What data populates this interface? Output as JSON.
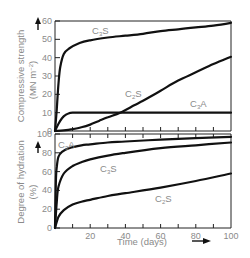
{
  "chart_data": [
    {
      "type": "line",
      "title": "",
      "xlabel": "Time (days)",
      "ylabel": "Compressive strength (MN m^-2)",
      "ylabel_line1": "Compressive strength",
      "ylabel_line2": "(MN m",
      "ylabel_sup": "-2",
      "ylabel_close": ")",
      "xlim": [
        0,
        100
      ],
      "ylim": [
        0,
        60
      ],
      "yticks": [
        "0",
        "10",
        "20",
        "30",
        "40",
        "50",
        "60"
      ],
      "xticks": [
        0,
        10,
        20,
        30,
        40,
        50,
        60,
        70,
        80,
        90,
        100
      ],
      "grid": false,
      "series": [
        {
          "name": "C3S",
          "label_main": "C",
          "label_sub": "3",
          "label_end": "S",
          "x": [
            0,
            1,
            2,
            3,
            5,
            8,
            14,
            20,
            30,
            40,
            50,
            60,
            70,
            80,
            90,
            100
          ],
          "values": [
            0,
            12,
            26,
            35,
            42,
            45,
            48,
            49.5,
            51,
            52,
            53,
            54.5,
            55.5,
            56.5,
            57.5,
            59
          ]
        },
        {
          "name": "C2S",
          "label_main": "C",
          "label_sub": "2",
          "label_end": "S",
          "x": [
            0,
            5,
            10,
            15,
            20,
            25,
            30,
            37,
            45,
            50,
            60,
            70,
            80,
            90,
            100
          ],
          "values": [
            0,
            0.3,
            1,
            2,
            3.5,
            5.5,
            7.5,
            10,
            14,
            16.5,
            22,
            27.5,
            32,
            36.5,
            40.5
          ]
        },
        {
          "name": "C3A",
          "label_main": "C",
          "label_sub": "3",
          "label_end": "A",
          "x": [
            0,
            2,
            4,
            6,
            8,
            10,
            20,
            40,
            60,
            80,
            100
          ],
          "values": [
            0,
            4,
            7,
            8.8,
            9.7,
            10,
            10,
            10,
            10,
            10,
            10
          ]
        }
      ]
    },
    {
      "type": "line",
      "title": "",
      "xlabel": "Time (days)",
      "ylabel": "Degree of hydration (%)",
      "ylabel_line1": "Degree of hydration",
      "ylabel_line2": "(%)",
      "xlim": [
        0,
        100
      ],
      "ylim": [
        0,
        100
      ],
      "yticks": [
        "0",
        "20",
        "40",
        "60",
        "80",
        "100"
      ],
      "xticks": [
        "20",
        "40",
        "60",
        "80",
        "100"
      ],
      "grid": false,
      "series": [
        {
          "name": "C3A",
          "label_main": "C",
          "label_sub": "3",
          "label_end": "A",
          "x": [
            0,
            0.5,
            1,
            2,
            4,
            8,
            15,
            20,
            30,
            40,
            60,
            80,
            100
          ],
          "values": [
            0,
            50,
            65,
            76,
            81,
            85,
            88,
            89,
            91,
            92,
            94,
            95.5,
            97
          ]
        },
        {
          "name": "C3S",
          "label_main": "C",
          "label_sub": "3",
          "label_end": "S",
          "x": [
            0,
            1,
            2,
            5,
            10,
            15,
            20,
            30,
            40,
            60,
            80,
            100
          ],
          "values": [
            0,
            28,
            44,
            58,
            66,
            70,
            73,
            77,
            80,
            85,
            88,
            91
          ]
        },
        {
          "name": "C2S",
          "label_main": "C",
          "label_sub": "2",
          "label_end": "S",
          "x": [
            0,
            2,
            5,
            10,
            15,
            20,
            30,
            40,
            60,
            80,
            100
          ],
          "values": [
            0,
            12,
            19,
            25,
            28,
            30,
            34,
            37,
            43,
            50,
            58
          ]
        }
      ]
    }
  ],
  "labels": {
    "xlabel": "Time (days)",
    "top_ylabel_1": "Compressive strength",
    "top_ylabel_2": "(MN m",
    "top_ylabel_sup": "−2",
    "top_ylabel_3": ")",
    "bot_ylabel_1": "Degree of hydration",
    "bot_ylabel_2": "(%)",
    "C": "C",
    "S": "S",
    "A": "A",
    "sub2": "2",
    "sub3": "3"
  },
  "ticks": {
    "top_y": [
      "0",
      "10",
      "20",
      "30",
      "40",
      "50",
      "60"
    ],
    "bot_y": [
      "0",
      "20",
      "40",
      "60",
      "80",
      "100"
    ],
    "x": [
      "20",
      "40",
      "60",
      "80",
      "100"
    ]
  }
}
